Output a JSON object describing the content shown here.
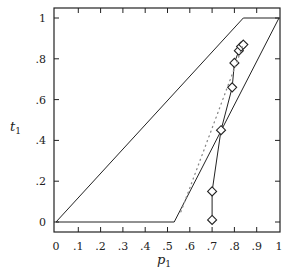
{
  "chart_data": {
    "type": "line",
    "title": "",
    "xlabel": "p1",
    "ylabel": "t1",
    "xlabel_main": "p",
    "xlabel_sub": "1",
    "ylabel_main": "t",
    "ylabel_sub": "1",
    "xlim": [
      0,
      1
    ],
    "ylim": [
      0,
      1
    ],
    "grid": false,
    "legend": null,
    "x_ticks": [
      0,
      0.1,
      0.2,
      0.3,
      0.4,
      0.5,
      0.6,
      0.7,
      0.8,
      0.9,
      1
    ],
    "x_tick_labels": [
      "0",
      ".1",
      ".2",
      ".3",
      ".4",
      ".5",
      ".6",
      ".7",
      ".8",
      ".9",
      "1"
    ],
    "y_ticks": [
      0,
      0.2,
      0.4,
      0.6,
      0.8,
      1
    ],
    "y_tick_labels": [
      "0",
      ".2",
      ".4",
      ".6",
      ".8",
      "1"
    ],
    "series": [
      {
        "name": "boundary-region",
        "style": "solid",
        "marker": "none",
        "x": [
          0,
          0.53,
          1,
          0.84,
          0
        ],
        "y": [
          0,
          0,
          1,
          1,
          0
        ]
      },
      {
        "name": "trajectory",
        "style": "solid",
        "marker": "diamond",
        "x": [
          0.7,
          0.7,
          0.74,
          0.79,
          0.8,
          0.82,
          0.83,
          0.84
        ],
        "y": [
          0.01,
          0.15,
          0.45,
          0.66,
          0.78,
          0.84,
          0.86,
          0.87
        ]
      },
      {
        "name": "reference",
        "style": "dotted",
        "marker": "none",
        "x": [
          0.56,
          0.84
        ],
        "y": [
          0.05,
          0.87
        ]
      }
    ]
  }
}
